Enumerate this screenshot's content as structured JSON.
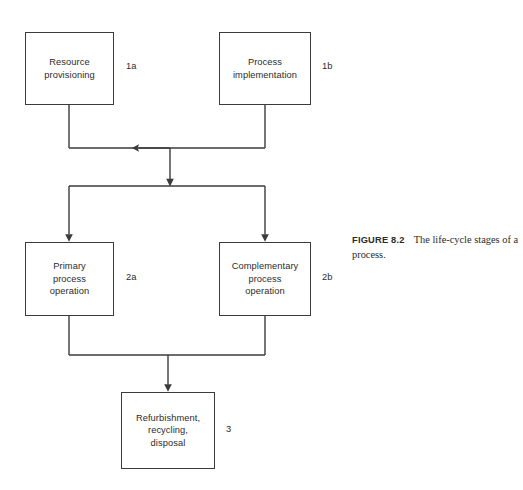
{
  "figure": {
    "caption_number": "FIGURE 8.2",
    "caption_text": "The life-cycle stages of a process.",
    "stroke_color": "#3b3b3b",
    "background_color": "#ffffff",
    "text_color": "#2b2b2b"
  },
  "nodes": [
    {
      "id": "resource-provisioning",
      "label": "Resource\nprovisioning",
      "tag": "1a"
    },
    {
      "id": "process-implementation",
      "label": "Process\nimplementation",
      "tag": "1b"
    },
    {
      "id": "primary-process-operation",
      "label": "Primary\nprocess\noperation",
      "tag": "2a"
    },
    {
      "id": "complementary-process-operation",
      "label": "Complementary\nprocess\noperation",
      "tag": "2b"
    },
    {
      "id": "refurbishment-recycling-disposal",
      "label": "Refurbishment,\nrecycling,\ndisposal",
      "tag": "3"
    }
  ]
}
